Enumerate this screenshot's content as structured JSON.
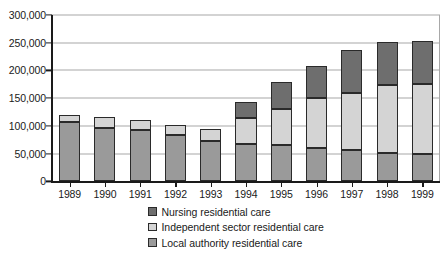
{
  "chart_data": {
    "type": "bar",
    "subtype": "stacked-vertical",
    "title": "",
    "xlabel": "",
    "ylabel": "",
    "ylim": [
      0,
      300000
    ],
    "ytick_step": 50000,
    "ytick_labels": [
      "0",
      "50,000",
      "100,000",
      "150,000",
      "200,000",
      "250,000",
      "300,000"
    ],
    "ytick_values": [
      0,
      50000,
      100000,
      150000,
      200000,
      250000,
      300000
    ],
    "grid": true,
    "grid_axis": "y",
    "legend_position": "bottom-center",
    "categories": [
      "1989",
      "1990",
      "1991",
      "1992",
      "1993",
      "1994",
      "1995",
      "1996",
      "1997",
      "1998",
      "1999"
    ],
    "stack_order_bottom_to_top": [
      "Local authority residential care",
      "Independent sector residential care",
      "Nursing residential care"
    ],
    "series": [
      {
        "name": "Local authority residential care",
        "color": "#9a9a9a",
        "values": [
          108000,
          96000,
          93000,
          84000,
          73000,
          67000,
          65000,
          60000,
          56000,
          52000,
          49000
        ]
      },
      {
        "name": "Independent sector residential care",
        "color": "#d4d4d4",
        "values": [
          12000,
          20000,
          17000,
          17000,
          22000,
          47000,
          65000,
          90000,
          103000,
          121000,
          126000
        ]
      },
      {
        "name": "Nursing residential care",
        "color": "#6e6e6e",
        "values": [
          0,
          0,
          0,
          0,
          0,
          30000,
          50000,
          58000,
          78000,
          79000,
          79000
        ]
      }
    ],
    "totals": [
      120000,
      116000,
      110000,
      101000,
      95000,
      144000,
      180000,
      208000,
      237000,
      252000,
      254000
    ]
  },
  "legend": {
    "items": [
      {
        "label": "Nursing residential care",
        "color": "#6e6e6e"
      },
      {
        "label": "Independent sector residential care",
        "color": "#d4d4d4"
      },
      {
        "label": "Local authority residential care",
        "color": "#9a9a9a"
      }
    ]
  },
  "colors": {
    "axis": "#1a1a1a",
    "gridline": "#a8a8a8",
    "bar_outline": "#2a2a2a",
    "background": "#ffffff"
  }
}
